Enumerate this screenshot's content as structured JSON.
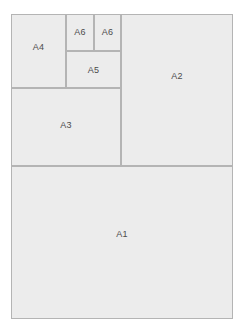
{
  "diagram": {
    "type": "nested-rectangle-subdivision",
    "colors": {
      "background": "#ffffff",
      "fill": "#ececec",
      "border": "#b4b4b4",
      "outer_border": "#a8a8a8",
      "label_text": "#4b4b4b"
    },
    "frame": {
      "name": "outer-sheet",
      "label": ""
    },
    "cells": [
      {
        "id": "a1",
        "label": "A1"
      },
      {
        "id": "a2",
        "label": "A2"
      },
      {
        "id": "a3",
        "label": "A3"
      },
      {
        "id": "a4",
        "label": "A4"
      },
      {
        "id": "a5",
        "label": "A5"
      },
      {
        "id": "a6a",
        "label": "A6"
      },
      {
        "id": "a6b",
        "label": "A6"
      }
    ]
  }
}
